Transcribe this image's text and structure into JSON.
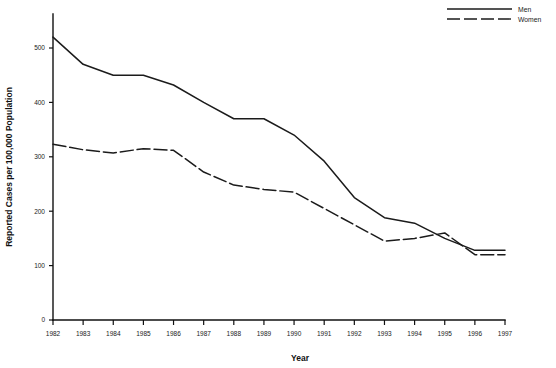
{
  "chart_data": {
    "type": "line",
    "title": "",
    "xlabel": "Year",
    "ylabel": "Reported Cases per 100,000 Population",
    "categories": [
      "1982",
      "1983",
      "1984",
      "1985",
      "1986",
      "1987",
      "1988",
      "1989",
      "1990",
      "1991",
      "1992",
      "1993",
      "1994",
      "1995",
      "1996",
      "1997"
    ],
    "x": [
      1982,
      1983,
      1984,
      1985,
      1986,
      1987,
      1988,
      1989,
      1990,
      1991,
      1992,
      1993,
      1994,
      1995,
      1996,
      1997
    ],
    "xlim": [
      1982,
      1997
    ],
    "ylim": [
      0,
      560
    ],
    "yticks": [
      0,
      100,
      200,
      300,
      400,
      500
    ],
    "ytick_labels": [
      "0",
      "100",
      "200",
      "300",
      "400",
      "500"
    ],
    "grid": false,
    "legend_position": "top-right",
    "series": [
      {
        "name": "Men",
        "style": "solid",
        "color": "#1b1b1b",
        "values": [
          520,
          470,
          450,
          450,
          432,
          400,
          370,
          370,
          340,
          292,
          225,
          188,
          178,
          150,
          128,
          128
        ]
      },
      {
        "name": "Women",
        "style": "dashed",
        "color": "#1b1b1b",
        "values": [
          323,
          313,
          307,
          315,
          312,
          272,
          248,
          240,
          235,
          205,
          175,
          145,
          150,
          160,
          120,
          120
        ]
      }
    ]
  },
  "axes": {
    "y_title": "Reported Cases per 100,000 Population",
    "x_title": "Year",
    "y_tick_labels": [
      "0",
      "100",
      "200",
      "300",
      "400",
      "500"
    ],
    "x_tick_labels": [
      "1982",
      "1983",
      "1984",
      "1985",
      "1986",
      "1987",
      "1988",
      "1989",
      "1990",
      "1991",
      "1992",
      "1993",
      "1994",
      "1995",
      "1996",
      "1997"
    ]
  },
  "legend": {
    "entries": [
      {
        "label": "Men",
        "style": "solid"
      },
      {
        "label": "Women",
        "style": "dashed"
      }
    ]
  }
}
